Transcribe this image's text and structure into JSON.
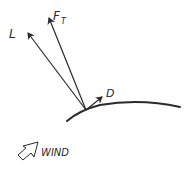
{
  "diagram": {
    "title": "",
    "labels": {
      "lift": "L",
      "total_force_main": "F",
      "total_force_sub": "T",
      "drag": "D",
      "wind": "WIND"
    },
    "colors": {
      "ink": "#2a2a2a",
      "background": "#ffffff"
    },
    "elements": [
      {
        "id": "lift-vector",
        "label": "L",
        "type": "arrow"
      },
      {
        "id": "total-force-vector",
        "label": "F_T",
        "type": "arrow"
      },
      {
        "id": "drag-vector",
        "label": "D",
        "type": "arrow"
      },
      {
        "id": "airfoil-curve",
        "type": "curve"
      },
      {
        "id": "wind-indicator",
        "label": "WIND",
        "type": "hollow-arrow"
      }
    ]
  }
}
